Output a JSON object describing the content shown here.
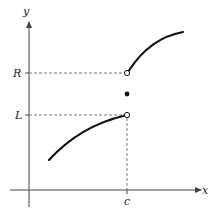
{
  "diagram": {
    "type": "function-graph",
    "axes": {
      "x_label": "x",
      "y_label": "y"
    },
    "labels": {
      "R": "R",
      "L": "L",
      "c": "c"
    },
    "points": [
      {
        "name": "left-limit-open-circle",
        "kind": "open",
        "at": "(c, L)"
      },
      {
        "name": "right-limit-open-circle",
        "kind": "open",
        "at": "(c, R)"
      },
      {
        "name": "function-value-dot",
        "kind": "filled",
        "at": "(c, f(c))"
      }
    ],
    "curves": [
      {
        "name": "left-branch",
        "from": "left",
        "to": "(c, L)",
        "shape": "concave-down increasing"
      },
      {
        "name": "right-branch",
        "from": "(c, R)",
        "to": "right",
        "shape": "concave-down increasing"
      }
    ],
    "colors": {
      "curve": "#111111",
      "axis": "#444444",
      "dashed": "#555555"
    }
  }
}
